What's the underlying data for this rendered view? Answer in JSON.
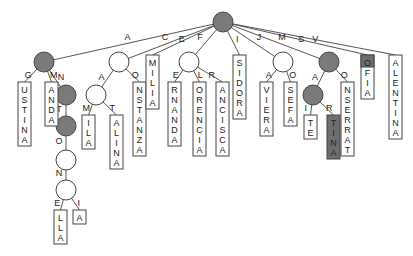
{
  "colors": {
    "filled_node": "#7a7a7a",
    "empty_node": "#ffffff",
    "highlight_box": "#6e6e6e",
    "stroke": "#444444"
  },
  "root": {
    "id": "root",
    "x": 223,
    "y": 22,
    "filled": true
  },
  "nodes": [
    {
      "id": "A",
      "x": 44,
      "y": 62,
      "filled": true,
      "parent": "root",
      "edge_label": "A"
    },
    {
      "id": "AN",
      "x": 66,
      "y": 95,
      "filled": true,
      "parent": "A",
      "edge_label": "N"
    },
    {
      "id": "ANT",
      "x": 66,
      "y": 126,
      "filled": true,
      "parent": "AN",
      "edge_label": "T"
    },
    {
      "id": "ANTO",
      "x": 66,
      "y": 160,
      "filled": false,
      "parent": "ANT",
      "edge_label": "O"
    },
    {
      "id": "ANTON",
      "x": 66,
      "y": 190,
      "filled": false,
      "parent": "ANTO",
      "edge_label": "N"
    },
    {
      "id": "C",
      "x": 119,
      "y": 62,
      "filled": false,
      "parent": "root",
      "edge_label": "C"
    },
    {
      "id": "CA",
      "x": 96,
      "y": 95,
      "filled": false,
      "parent": "C",
      "edge_label": "A"
    },
    {
      "id": "F",
      "x": 189,
      "y": 62,
      "filled": false,
      "parent": "root",
      "edge_label": "F"
    },
    {
      "id": "J",
      "x": 283,
      "y": 62,
      "filled": false,
      "parent": "root",
      "edge_label": "J"
    },
    {
      "id": "M",
      "x": 329,
      "y": 62,
      "filled": true,
      "parent": "root",
      "edge_label": "M"
    },
    {
      "id": "MA",
      "x": 313,
      "y": 95,
      "filled": true,
      "parent": "M",
      "edge_label": "A"
    }
  ],
  "leaves": [
    {
      "parent": "A",
      "edge_label": "G",
      "text": "USTINA",
      "x": 18,
      "y": 82,
      "dark": false
    },
    {
      "parent": "A",
      "edge_label": "M",
      "text": "ANDA",
      "x": 45,
      "y": 82,
      "dark": false
    },
    {
      "parent": "ANTON",
      "edge_label": "E",
      "text": "LLA",
      "x": 54,
      "y": 210,
      "dark": false
    },
    {
      "parent": "ANTON",
      "edge_label": "I",
      "text": "A",
      "x": 73,
      "y": 210,
      "dark": false
    },
    {
      "parent": "CA",
      "edge_label": "M",
      "text": "ILA",
      "x": 82,
      "y": 115,
      "dark": false
    },
    {
      "parent": "CA",
      "edge_label": "T",
      "text": "ALINA",
      "x": 110,
      "y": 115,
      "dark": false
    },
    {
      "parent": "C",
      "edge_label": "O",
      "text": "NSTANZA",
      "x": 133,
      "y": 82,
      "dark": false
    },
    {
      "parent": "root",
      "edge_label": "E",
      "text": "MILIA",
      "x": 146,
      "y": 55,
      "dark": false
    },
    {
      "parent": "F",
      "edge_label": "E",
      "text": "RNANDA",
      "x": 168,
      "y": 82,
      "dark": false
    },
    {
      "parent": "F",
      "edge_label": "L",
      "text": "ORENCIA",
      "x": 193,
      "y": 82,
      "dark": false
    },
    {
      "parent": "F",
      "edge_label": "R",
      "text": "ANCISCA",
      "x": 216,
      "y": 82,
      "dark": false
    },
    {
      "parent": "root",
      "edge_label": "I",
      "text": "SIDORA",
      "x": 233,
      "y": 55,
      "dark": false
    },
    {
      "parent": "J",
      "edge_label": "A",
      "text": "VIERA",
      "x": 260,
      "y": 82,
      "dark": false
    },
    {
      "parent": "J",
      "edge_label": "O",
      "text": "SEFA",
      "x": 284,
      "y": 82,
      "dark": false
    },
    {
      "parent": "MA",
      "edge_label": "I",
      "text": "TE",
      "x": 304,
      "y": 115,
      "dark": false
    },
    {
      "parent": "MA",
      "edge_label": "R",
      "text": "TINA",
      "x": 327,
      "y": 115,
      "dark": true
    },
    {
      "parent": "M",
      "edge_label": "O",
      "text": "NSERRAT",
      "x": 341,
      "y": 82,
      "dark": false
    },
    {
      "parent": "root",
      "edge_label": "S",
      "text": "OFIA",
      "x": 361,
      "y": 55,
      "dark": false,
      "first_letter_dark": true
    },
    {
      "parent": "root",
      "edge_label": "V",
      "text": "ALENTINA",
      "x": 389,
      "y": 55,
      "dark": false
    }
  ]
}
